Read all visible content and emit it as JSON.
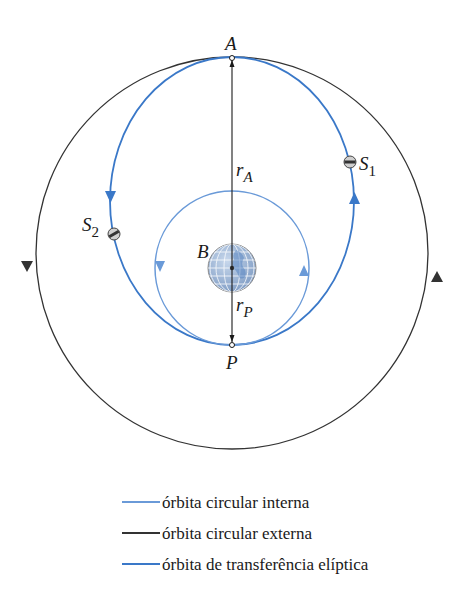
{
  "diagram": {
    "points": {
      "apoapsis_label": "A",
      "periapsis_label": "P",
      "body_label": "B",
      "satellite1_label": "S",
      "satellite1_sub": "1",
      "satellite2_label": "S",
      "satellite2_sub": "2",
      "rA_label": "r",
      "rA_sub": "A",
      "rP_label": "r",
      "rP_sub": "P"
    },
    "colors": {
      "inner_orbit": "#6a9ad8",
      "outer_orbit": "#333333",
      "transfer_orbit": "#3a78c8",
      "earth_fill": "#9fb8d8",
      "earth_grid": "#ffffff"
    },
    "legend": [
      {
        "label": "órbita circular interna",
        "color": "#6a9ad8"
      },
      {
        "label": "órbita circular externa",
        "color": "#333333"
      },
      {
        "label": "órbita de transferência elíptica",
        "color": "#3a78c8"
      }
    ]
  }
}
